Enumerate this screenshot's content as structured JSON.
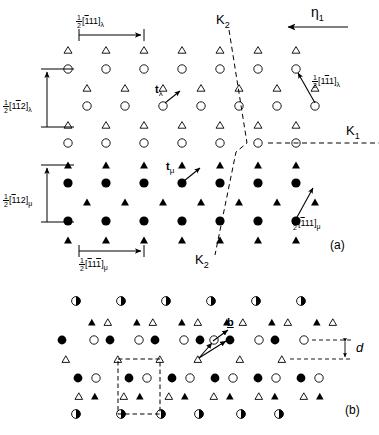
{
  "figure": {
    "width": 379,
    "height": 435,
    "background": "#ffffff",
    "ink": "#000000"
  },
  "panels": [
    {
      "id": "a",
      "label": "(a)",
      "x": 330,
      "y": 243
    },
    {
      "id": "b",
      "label": "(b)",
      "x": 345,
      "y": 410
    }
  ],
  "annotations": {
    "eta1": {
      "text": "η",
      "sub": "1",
      "x": 312,
      "y": 12
    },
    "k2_top": {
      "text": "K",
      "sub": "2",
      "x": 218,
      "y": 18
    },
    "k2_bottom": {
      "text": "K",
      "sub": "2",
      "x": 197,
      "y": 258
    },
    "k1": {
      "text": "K",
      "sub": "1",
      "x": 348,
      "y": 131
    },
    "t_lambda": {
      "text": "t",
      "sub": "λ",
      "x": 157,
      "y": 88
    },
    "t_mu": {
      "text": "t",
      "sub": "μ",
      "x": 167,
      "y": 165
    },
    "burgers": {
      "text": "b",
      "x": 228,
      "y": 322
    },
    "spacing_d": {
      "text": "d",
      "x": 358,
      "y": 344
    }
  },
  "miller_labels": [
    {
      "name": "half-1bar11-lambda",
      "num": "1",
      "den": "2",
      "indices": [
        {
          "digit": "1",
          "bar": true
        },
        {
          "digit": "1",
          "bar": false
        },
        {
          "digit": "1",
          "bar": false
        }
      ],
      "subscript": "λ",
      "x": 76,
      "y": 18,
      "text": "½[̇1̇11]λ"
    },
    {
      "name": "half-1bar1bar2-lambda",
      "num": "1",
      "den": "2",
      "indices": [
        {
          "digit": "1",
          "bar": false
        },
        {
          "digit": "1",
          "bar": true
        },
        {
          "digit": "2",
          "bar": false
        }
      ],
      "subscript": "λ",
      "x": 4,
      "y": 102,
      "text": "½[11̇2]λ"
    },
    {
      "name": "half-11bar1-lambda",
      "num": "1",
      "den": "2",
      "indices": [
        {
          "digit": "1",
          "bar": false
        },
        {
          "digit": "1",
          "bar": true
        },
        {
          "digit": "1",
          "bar": false
        }
      ],
      "subscript": "λ",
      "x": 313,
      "y": 78,
      "text": "½[11̇1]λ"
    },
    {
      "name": "half-1bar12-mu",
      "num": "1",
      "den": "2",
      "indices": [
        {
          "digit": "1",
          "bar": true
        },
        {
          "digit": "1",
          "bar": false
        },
        {
          "digit": "2",
          "bar": false
        }
      ],
      "subscript": "μ",
      "x": 4,
      "y": 196,
      "text": "½[̇11 2]μ"
    },
    {
      "name": "half-1bar11-mu",
      "num": "1",
      "den": "2",
      "indices": [
        {
          "digit": "1",
          "bar": true
        },
        {
          "digit": "1",
          "bar": false
        },
        {
          "digit": "1",
          "bar": false
        }
      ],
      "subscript": "μ",
      "x": 293,
      "y": 219,
      "text": "½[̇11 1]μ"
    },
    {
      "name": "half-1bar11bar-mu",
      "num": "1",
      "den": "2",
      "indices": [
        {
          "digit": "1",
          "bar": true
        },
        {
          "digit": "1",
          "bar": false
        },
        {
          "digit": "1",
          "bar": true
        }
      ],
      "subscript": "μ",
      "x": 80,
      "y": 260,
      "text": "½[̇11̇1]μ"
    }
  ],
  "legend_symbols": {
    "open_circle": "open-circle",
    "filled_circle": "filled-circle",
    "half_circle": "half-filled-circle",
    "open_triangle": "open-triangle",
    "filled_triangle": "filled-triangle"
  },
  "panel_a": {
    "open_circles": [
      [
        68,
        69
      ],
      [
        106,
        69
      ],
      [
        144,
        69
      ],
      [
        182,
        69
      ],
      [
        220,
        69
      ],
      [
        258,
        69
      ],
      [
        296,
        69
      ],
      [
        334,
        69
      ],
      [
        68,
        106
      ],
      [
        106,
        106
      ],
      [
        144,
        106
      ],
      [
        182,
        106
      ],
      [
        220,
        106
      ],
      [
        258,
        106
      ],
      [
        296,
        106
      ],
      [
        334,
        106
      ],
      [
        68,
        143
      ],
      [
        106,
        143
      ],
      [
        144,
        143
      ],
      [
        182,
        143
      ],
      [
        220,
        143
      ],
      [
        258,
        143
      ],
      [
        296,
        143
      ],
      [
        334,
        143
      ]
    ],
    "open_triangles": [
      [
        68,
        50
      ],
      [
        106,
        50
      ],
      [
        144,
        50
      ],
      [
        182,
        50
      ],
      [
        220,
        50
      ],
      [
        258,
        50
      ],
      [
        296,
        50
      ],
      [
        334,
        50
      ],
      [
        68,
        88
      ],
      [
        106,
        88
      ],
      [
        144,
        88
      ],
      [
        182,
        88
      ],
      [
        220,
        88
      ],
      [
        258,
        88
      ],
      [
        296,
        88
      ],
      [
        334,
        88
      ],
      [
        68,
        125
      ],
      [
        106,
        125
      ],
      [
        144,
        125
      ],
      [
        182,
        125
      ],
      [
        220,
        125
      ],
      [
        258,
        125
      ],
      [
        296,
        125
      ],
      [
        334,
        125
      ]
    ],
    "filled_circles": [
      [
        68,
        183
      ],
      [
        106,
        183
      ],
      [
        144,
        183
      ],
      [
        182,
        183
      ],
      [
        220,
        183
      ],
      [
        258,
        183
      ],
      [
        296,
        183
      ],
      [
        68,
        221
      ],
      [
        106,
        221
      ],
      [
        144,
        221
      ],
      [
        182,
        221
      ],
      [
        220,
        221
      ],
      [
        258,
        221
      ],
      [
        296,
        221
      ]
    ],
    "filled_triangles": [
      [
        68,
        165
      ],
      [
        106,
        165
      ],
      [
        144,
        165
      ],
      [
        182,
        165
      ],
      [
        220,
        165
      ],
      [
        258,
        165
      ],
      [
        296,
        165
      ],
      [
        68,
        202
      ],
      [
        106,
        202
      ],
      [
        144,
        202
      ],
      [
        182,
        202
      ],
      [
        220,
        202
      ],
      [
        258,
        202
      ],
      [
        296,
        202
      ],
      [
        68,
        240
      ],
      [
        106,
        240
      ],
      [
        144,
        240
      ],
      [
        182,
        240
      ],
      [
        220,
        240
      ],
      [
        258,
        240
      ],
      [
        296,
        240
      ]
    ]
  },
  "panel_b": {
    "half_circles_top_y": 301,
    "half_circles_bottom_y": 414,
    "half_circle_xs": [
      76,
      114,
      152,
      190,
      228,
      266
    ],
    "row_triangles_upper_y": 322,
    "row_circles_mid_y": 340,
    "row_triangles_mid_y": 359,
    "row_circles_low_y": 378,
    "row_triangles_low_y": 396
  }
}
